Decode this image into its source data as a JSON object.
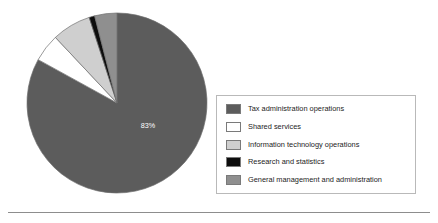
{
  "chart_data": {
    "type": "pie",
    "title": "",
    "subtitle": "",
    "xlabel": "",
    "ylabel": "",
    "grid": false,
    "legend_position": "right",
    "start_angle_deg": 0,
    "direction": "clockwise",
    "categories": [
      "Tax administration operations",
      "Shared services",
      "Information technology operations",
      "Research and statistics",
      "General management and administration"
    ],
    "values": [
      83,
      5,
      7,
      1,
      4
    ],
    "colors": [
      "#5c5c5c",
      "#ffffff",
      "#cfcfcf",
      "#0d0d0d",
      "#8f8f8f"
    ],
    "data_labels": [
      {
        "category": "Tax administration operations",
        "text": "83%",
        "value": 83
      }
    ],
    "annotations": []
  },
  "legend": {
    "items": [
      {
        "label": "Tax administration operations",
        "color": "#5c5c5c"
      },
      {
        "label": "Shared services",
        "color": "#ffffff"
      },
      {
        "label": "Information technology operations",
        "color": "#cfcfcf"
      },
      {
        "label": "Research and statistics",
        "color": "#0d0d0d"
      },
      {
        "label": "General management and administration",
        "color": "#8f8f8f"
      }
    ]
  },
  "pie_label": {
    "text": "83%"
  }
}
